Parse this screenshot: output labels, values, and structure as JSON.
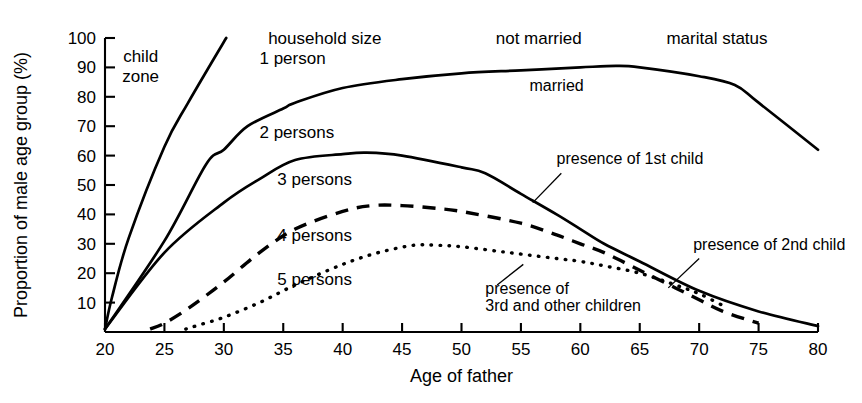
{
  "chart_data": {
    "type": "line",
    "title": "",
    "xlabel": "Age of father",
    "ylabel": "Proportion of male age group (%)",
    "xlim": [
      20,
      80
    ],
    "ylim": [
      0,
      100
    ],
    "xticks": [
      20,
      25,
      30,
      35,
      40,
      45,
      50,
      55,
      60,
      65,
      70,
      75,
      80
    ],
    "yticks": [
      10,
      20,
      30,
      40,
      50,
      60,
      70,
      80,
      90,
      100
    ],
    "grid": false,
    "legend_position": "inline-annotations",
    "group_labels": [
      {
        "text": "child zone",
        "x": 23.0,
        "y": 92
      },
      {
        "text": "household size",
        "x": 38.5,
        "y": 98
      },
      {
        "text": "not married",
        "x": 56.5,
        "y": 98
      },
      {
        "text": "marital status",
        "x": 71.5,
        "y": 98
      }
    ],
    "annotations": [
      {
        "text": "married",
        "x": 58.0,
        "y": 82
      },
      {
        "text": "presence of 1st child",
        "x": 58.0,
        "y": 57
      },
      {
        "text": "presence of 2nd child",
        "x": 69.5,
        "y": 28
      },
      {
        "text": "presence of",
        "x": 52.0,
        "y": 13
      },
      {
        "text": "3rd and other children",
        "x": 52.0,
        "y": 7
      }
    ],
    "series": [
      {
        "name": "not married",
        "label": "",
        "style": "solid",
        "x": [
          20.0,
          20.6,
          22.0,
          25.0,
          27.0,
          30.2
        ],
        "values": [
          1,
          12,
          32,
          63,
          78,
          100
        ]
      },
      {
        "name": "1 person",
        "label": "1 person",
        "label_x": 33.0,
        "label_y": 91,
        "style": "solid",
        "x": [
          20.0,
          25.0,
          28.5,
          30.0,
          32.0,
          35.0,
          36.0,
          40.0,
          45.0,
          50.0,
          55.0,
          60.0,
          63.0,
          65.0,
          70.0,
          73.0,
          75.0,
          80.0
        ],
        "values": [
          1,
          31,
          57,
          62,
          70,
          76,
          78,
          83,
          86,
          88,
          89,
          90,
          90.5,
          90,
          87,
          84,
          78,
          62
        ]
      },
      {
        "name": "2 persons",
        "label": "2 persons",
        "label_x": 33.0,
        "label_y": 66,
        "style": "solid",
        "x": [
          20.0,
          25.0,
          30.0,
          33.0,
          36.0,
          40.0,
          42.0,
          45.0,
          50.0,
          52.0,
          55.0,
          58.0,
          60.0,
          62.0,
          65.0,
          70.0,
          75.0,
          80.0
        ],
        "values": [
          1,
          27,
          44,
          52,
          58.5,
          60.5,
          61,
          60,
          56,
          54,
          47,
          40,
          35,
          30,
          24,
          14,
          7,
          2
        ]
      },
      {
        "name": "3 persons",
        "label": "3 persons",
        "label_x": 34.5,
        "label_y": 50,
        "style": "dashed",
        "x": [
          23.8,
          25.0,
          27.0,
          30.0,
          33.0,
          36.0,
          40.0,
          42.5,
          45.0,
          48.0,
          50.0,
          55.0,
          58.0,
          60.0,
          62.0,
          65.0,
          68.0,
          70.0,
          72.0,
          75.0
        ],
        "values": [
          1,
          3,
          8,
          17,
          27,
          35,
          41,
          43,
          43,
          42,
          41,
          37,
          33,
          30,
          27,
          21,
          15,
          11,
          7,
          3
        ]
      },
      {
        "name": "4 persons",
        "label": "4 persons",
        "label_x": 34.5,
        "label_y": 31,
        "style": "dotted",
        "x": [
          26.8,
          28.0,
          30.0,
          33.0,
          36.0,
          40.0,
          43.0,
          46.0,
          48.0,
          50.0,
          53.0,
          55.0,
          58.0,
          60.0,
          62.0,
          65.0,
          68.0,
          70.0,
          72.0
        ],
        "values": [
          1,
          2.5,
          5,
          10,
          16,
          23,
          27,
          29.5,
          29.5,
          29,
          27.5,
          26.5,
          25,
          24,
          22.5,
          20,
          16,
          13,
          9
        ]
      },
      {
        "name": "5 persons",
        "label": "5 persons",
        "label_x": 34.5,
        "label_y": 16,
        "style": "none",
        "x": [],
        "values": []
      }
    ]
  }
}
